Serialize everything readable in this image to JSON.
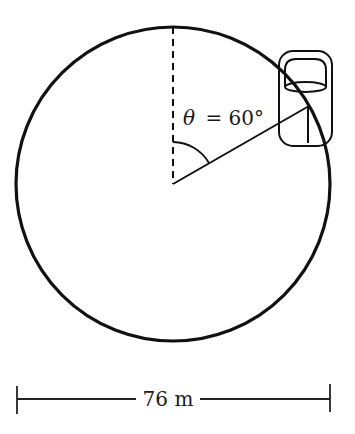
{
  "diagram": {
    "type": "ferris-wheel-geometry",
    "angle_label": {
      "symbol": "θ",
      "equals": "= 60°",
      "value_degrees": 60
    },
    "dimension_label": "76 m",
    "diameter_m": 76,
    "colors": {
      "stroke": "#111111",
      "background": "#ffffff"
    },
    "elements": [
      "circle",
      "vertical-dashed-radius",
      "rotated-radius",
      "angle-arc",
      "gondola-car",
      "diameter-dimension-line"
    ]
  }
}
